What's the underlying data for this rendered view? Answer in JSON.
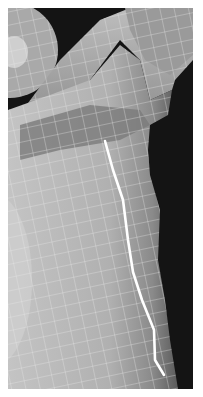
{
  "image": {
    "description": "3D polygon mesh render of a character torso/shoulder with wireframe overlay and a highlighted white edge loop",
    "colors": {
      "background": "#111111",
      "mesh_light": "#c8c8c8",
      "mesh_mid": "#a8a8a8",
      "mesh_dark": "#777777",
      "wire": "#e6e6e6",
      "highlight_edge": "#ffffff",
      "page_margin": "#ffffff"
    },
    "highlight_path": [
      [
        105,
        141
      ],
      [
        113,
        170
      ],
      [
        123,
        200
      ],
      [
        128,
        240
      ],
      [
        133,
        272
      ],
      [
        142,
        300
      ],
      [
        154,
        330
      ],
      [
        155,
        360
      ],
      [
        164,
        375
      ]
    ]
  }
}
